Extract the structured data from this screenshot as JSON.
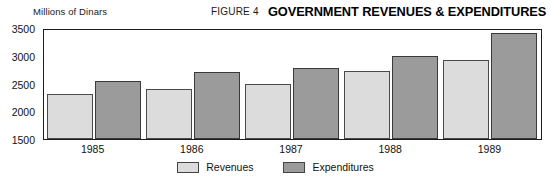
{
  "header": {
    "figure_number": "FIGURE 4",
    "title": "GOVERNMENT REVENUES & EXPENDITURES",
    "unit_label": "Millions of Dinars"
  },
  "legend": {
    "position": "bottom-center",
    "entries": [
      {
        "label": "Revenues",
        "color": "#dcdcdc",
        "swatch_name": "legend-swatch-revenues"
      },
      {
        "label": "Expenditures",
        "color": "#9b9b9b",
        "swatch_name": "legend-swatch-expenditures"
      }
    ]
  },
  "chart_data": {
    "type": "bar",
    "title": "GOVERNMENT REVENUES & EXPENDITURES",
    "subtitle": "FIGURE 4",
    "xlabel": "",
    "ylabel": "Millions of Dinars",
    "categories": [
      "1985",
      "1986",
      "1987",
      "1988",
      "1989"
    ],
    "series": [
      {
        "name": "Revenues",
        "color": "#dcdcdc",
        "values": [
          2330,
          2420,
          2510,
          2750,
          2950
        ]
      },
      {
        "name": "Expenditures",
        "color": "#9b9b9b",
        "values": [
          2570,
          2730,
          2810,
          3020,
          3440
        ]
      }
    ],
    "ylim": [
      1500,
      3500
    ],
    "ytick_values": [
      1500,
      2000,
      2500,
      3000,
      3500
    ],
    "ytick_labels": [
      "1500",
      "2000",
      "2500",
      "3000",
      "3500"
    ],
    "grid": false,
    "legend_position": "bottom-center"
  }
}
